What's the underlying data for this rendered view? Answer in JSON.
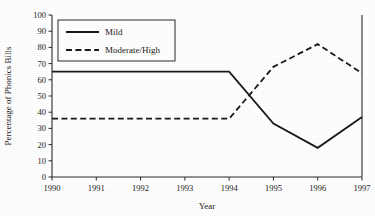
{
  "chart_data": {
    "type": "line",
    "title": "",
    "xlabel": "Year",
    "ylabel": "Percentage of Phonics Bills",
    "categories": [
      "1990",
      "1991",
      "1992",
      "1993",
      "1994",
      "1995",
      "1996",
      "1997"
    ],
    "x": [
      1990,
      1991,
      1992,
      1993,
      1994,
      1995,
      1996,
      1997
    ],
    "xlim": [
      1990,
      1997
    ],
    "ylim": [
      0,
      100
    ],
    "ytick_values": [
      0,
      10,
      20,
      30,
      40,
      50,
      60,
      70,
      80,
      90,
      100
    ],
    "ytick_labels": [
      "0",
      "10",
      "20",
      "30",
      "40",
      "50",
      "60",
      "70",
      "80",
      "90",
      "100"
    ],
    "xtick_labels": [
      "1990",
      "1991",
      "1992",
      "1993",
      "1994",
      "1995",
      "1996",
      "1997"
    ],
    "grid": false,
    "legend_position": "upper left",
    "series": [
      {
        "name": "Mild",
        "style": "solid",
        "color": "#1a1a1a",
        "values": [
          65,
          65,
          65,
          65,
          65,
          33,
          18,
          37
        ]
      },
      {
        "name": "Moderate/High",
        "style": "dashed",
        "color": "#1a1a1a",
        "values": [
          36,
          36,
          36,
          36,
          36,
          68,
          82,
          64
        ]
      }
    ]
  },
  "legend": {
    "entries": [
      {
        "label": "Mild"
      },
      {
        "label": "Moderate/High"
      }
    ]
  },
  "axes": {
    "y_title": "Percentage of Phonics Bills",
    "x_title": "Year"
  }
}
